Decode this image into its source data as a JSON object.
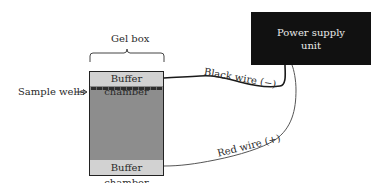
{
  "diagram": {
    "gel_box": {
      "label": "Gel box",
      "top_chamber": "Buffer chamber",
      "bottom_chamber": "Buffer chamber",
      "wells_label": "Sample wells"
    },
    "power_supply": {
      "line1": "Power supply",
      "line2": "unit"
    },
    "wires": {
      "black": "Black wire (−)",
      "red": "Red wire (+)"
    },
    "colors": {
      "gel": "#8d8d8d",
      "chamber": "#d2d2d2",
      "power_supply": "#111111",
      "wire": "#222222"
    }
  }
}
